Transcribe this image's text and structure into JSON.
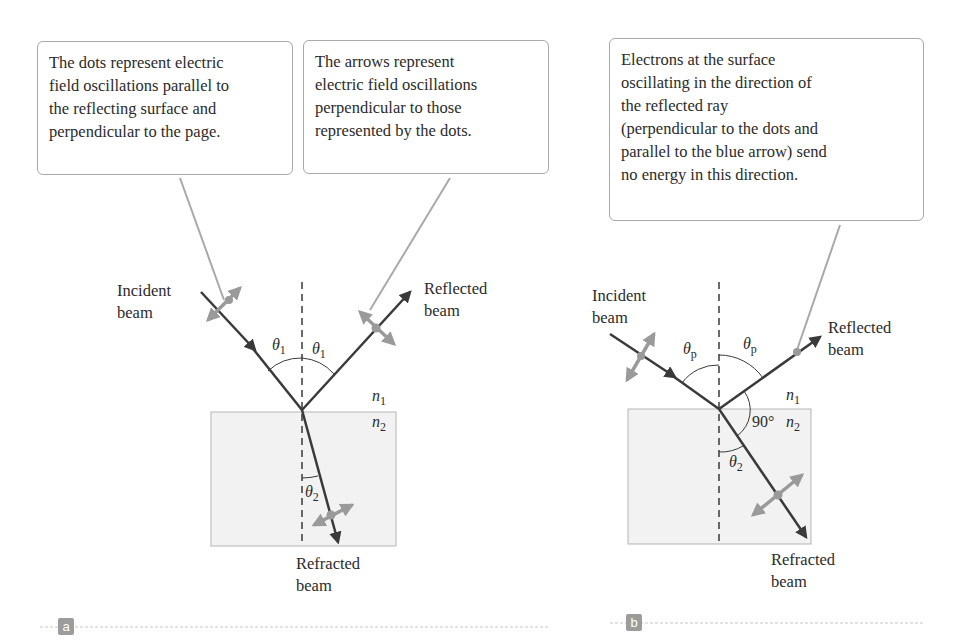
{
  "panels": [
    {
      "tag": "a",
      "callouts": [
        {
          "lines": [
            "The dots represent electric",
            "field oscillations parallel to",
            "the reflecting surface and",
            "perpendicular to the page."
          ]
        },
        {
          "lines": [
            "The arrows represent",
            "electric field oscillations",
            "perpendicular to those",
            "represented by the dots."
          ]
        }
      ],
      "labels": {
        "incident": [
          "Incident",
          "beam"
        ],
        "reflected": [
          "Reflected",
          "beam"
        ],
        "refracted": [
          "Refracted",
          "beam"
        ]
      },
      "angles": {
        "incident": "θ",
        "incident_sub": "1",
        "reflected": "θ",
        "reflected_sub": "1",
        "refracted": "θ",
        "refracted_sub": "2"
      },
      "media": {
        "n1": "n",
        "n1_sub": "1",
        "n2": "n",
        "n2_sub": "2"
      }
    },
    {
      "tag": "b",
      "callouts": [
        {
          "lines": [
            "Electrons at the surface",
            "oscillating in the direction of",
            "the reflected ray",
            "(perpendicular to the dots and",
            "parallel to the blue arrow) send",
            "no energy in this direction."
          ]
        }
      ],
      "labels": {
        "incident": [
          "Incident",
          "beam"
        ],
        "reflected": [
          "Reflected",
          "beam"
        ],
        "refracted": [
          "Refracted",
          "beam"
        ]
      },
      "angles": {
        "incident": "θ",
        "incident_sub": "p",
        "reflected": "θ",
        "reflected_sub": "p",
        "refracted": "θ",
        "refracted_sub": "2",
        "right_angle": "90°"
      },
      "media": {
        "n1": "n",
        "n1_sub": "1",
        "n2": "n",
        "n2_sub": "2"
      }
    }
  ],
  "colors": {
    "beam": "#3a3a3a",
    "oscillation": "#9a9a9a",
    "medium_fill": "#f2f2f2",
    "medium_border": "#b5b5b5",
    "callout_border": "#a9a9a9",
    "tag_bg": "#9c9c9c"
  }
}
